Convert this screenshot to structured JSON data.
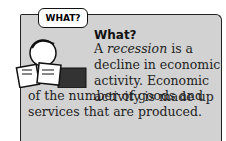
{
  "sidebar": {
    "speech_bubble": "WHAT?",
    "heading": "What?",
    "text_lines_right": [
      "A recession is a",
      "decline in economic",
      "activity. Economic",
      "activity is made up"
    ],
    "text_lines_full": [
      "of the number of goods and",
      "services that are produced."
    ],
    "italic_term": "recession",
    "colors": {
      "panel": "#d2d2d2",
      "border": "#222222",
      "text": "#222222"
    }
  }
}
